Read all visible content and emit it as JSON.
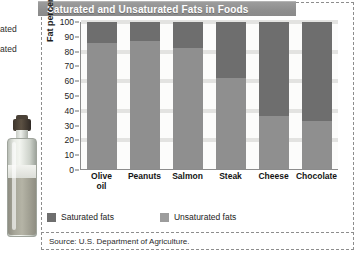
{
  "title": "Saturated and Unsaturated Fats in Foods",
  "edge_fragments": {
    "saturated": "ated",
    "unsaturated": "ated"
  },
  "legend": {
    "saturated_label": "Saturated fats",
    "unsaturated_label": "Unsaturated fats"
  },
  "source": "Source: U.S. Department of Agriculture.",
  "colors": {
    "saturated": "#6e6e6e",
    "unsaturated": "#8f8f8f",
    "banner": "#8f8f8f",
    "band": "#e3e3e1"
  },
  "chart_data": {
    "type": "bar",
    "title": "Saturated and Unsaturated Fats in Foods",
    "xlabel": "",
    "ylabel": "Fat percentage",
    "ylim": [
      0,
      100
    ],
    "yticks": [
      100,
      90,
      80,
      70,
      60,
      50,
      40,
      30,
      20,
      10,
      0
    ],
    "grid": true,
    "legend_position": "bottom-left",
    "stacked": true,
    "categories": [
      "Olive oil",
      "Peanuts",
      "Salmon",
      "Steak",
      "Cheese",
      "Chocolate"
    ],
    "category_lines": [
      [
        "Olive",
        "oil"
      ],
      [
        "Peanuts"
      ],
      [
        "Salmon"
      ],
      [
        "Steak"
      ],
      [
        "Cheese"
      ],
      [
        "Chocolate"
      ]
    ],
    "series": [
      {
        "name": "Saturated fats",
        "color": "#6e6e6e",
        "values": [
          14,
          13,
          18,
          38,
          64,
          67
        ]
      },
      {
        "name": "Unsaturated fats",
        "color": "#8f8f8f",
        "values": [
          86,
          87,
          82,
          62,
          36,
          33
        ]
      }
    ],
    "totals": [
      100,
      100,
      100,
      100,
      100,
      100
    ],
    "annotations": [
      "Source: U.S. Department of Agriculture."
    ]
  }
}
